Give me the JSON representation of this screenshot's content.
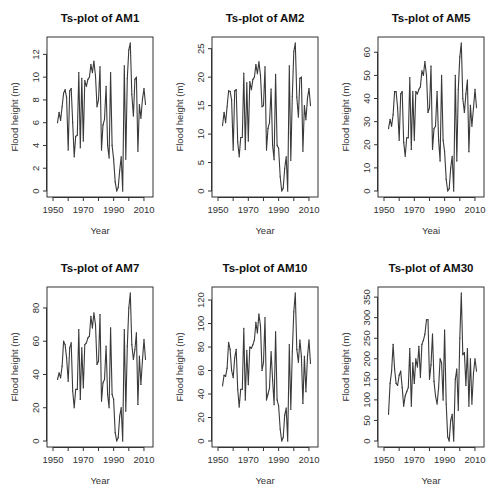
{
  "chart_data": [
    {
      "type": "line",
      "title": "Ts-plot of AM1",
      "xlabel": "Year",
      "ylabel": "Flood height (m)",
      "xlim": [
        1950,
        2012
      ],
      "ylim": [
        0,
        13
      ],
      "xticks": [
        1950,
        1970,
        1990,
        2010
      ],
      "x_minor_ticks": [
        1950,
        1960,
        1970,
        1980,
        1990,
        2000,
        2010
      ],
      "yticks": [
        0,
        2,
        4,
        6,
        8,
        10,
        12
      ],
      "grid": false,
      "x_start": 1953,
      "values": [
        6.0,
        6.9,
        6.2,
        7.4,
        8.6,
        8.9,
        8.2,
        3.6,
        8.8,
        9.0,
        6.0,
        3.0,
        4.8,
        4.9,
        10.4,
        3.8,
        9.9,
        4.4,
        9.7,
        9.2,
        9.8,
        10.0,
        11.1,
        10.4,
        11.4,
        10.1,
        7.4,
        8.0,
        10.9,
        3.6,
        5.8,
        6.3,
        9.2,
        4.0,
        2.9,
        10.4,
        4.0,
        2.8,
        0.8,
        0.0,
        0.3,
        1.8,
        3.0,
        0.0,
        11.0,
        2.8,
        9.9,
        12.4,
        13.0,
        8.5,
        6.6,
        9.8,
        10.0,
        3.5,
        7.6,
        6.4,
        8.1,
        9.0,
        7.6
      ]
    },
    {
      "type": "line",
      "title": "Ts-plot of AM2",
      "xlabel": "Year",
      "ylabel": "Flood height (m)",
      "xlim": [
        1950,
        2012
      ],
      "ylim": [
        0,
        26
      ],
      "xticks": [
        1950,
        1970,
        1990,
        2010
      ],
      "x_minor_ticks": [
        1950,
        1960,
        1970,
        1980,
        1990,
        2000,
        2010
      ],
      "yticks": [
        0,
        5,
        10,
        15,
        20,
        25
      ],
      "grid": false,
      "x_start": 1953,
      "values": [
        11.5,
        13.8,
        12.0,
        14.8,
        17.6,
        17.5,
        16.0,
        7.2,
        17.6,
        17.8,
        8.6,
        6.0,
        9.4,
        9.4,
        20.7,
        7.3,
        19.0,
        8.8,
        19.2,
        17.8,
        19.6,
        20.0,
        22.2,
        20.6,
        22.7,
        20.3,
        14.8,
        15.0,
        21.8,
        7.2,
        11.0,
        12.0,
        17.9,
        8.0,
        5.5,
        20.5,
        8.0,
        7.5,
        2.5,
        0.0,
        0.5,
        4.0,
        6.0,
        0.0,
        22.0,
        5.4,
        16.6,
        24.5,
        26.0,
        16.5,
        13.0,
        19.8,
        20.0,
        7.0,
        15.0,
        12.5,
        16.3,
        18.0,
        15.0
      ]
    },
    {
      "type": "line",
      "title": "Ts-plot of AM5",
      "xlabel": "Yeai",
      "ylabel": "Flood height (m)",
      "xlim": [
        1950,
        2012
      ],
      "ylim": [
        0,
        64
      ],
      "xticks": [
        1950,
        1970,
        1990,
        2010
      ],
      "x_minor_ticks": [
        1950,
        1960,
        1970,
        1980,
        1990,
        2000,
        2010
      ],
      "yticks": [
        0,
        10,
        20,
        30,
        40,
        50,
        60
      ],
      "grid": false,
      "x_start": 1953,
      "values": [
        27,
        31,
        28,
        33,
        43,
        43,
        36,
        22,
        42,
        43,
        21,
        15,
        23,
        23,
        49,
        18,
        43,
        22,
        43,
        42,
        44,
        45,
        52,
        50,
        56,
        50,
        34,
        36,
        54,
        18,
        27,
        28,
        43,
        22,
        13,
        50,
        22,
        17,
        5,
        0,
        1,
        10,
        15,
        0,
        50,
        13,
        44,
        58,
        64,
        40,
        34,
        42,
        48,
        17,
        37,
        28,
        36,
        44,
        36
      ]
    },
    {
      "type": "line",
      "title": "Ts-plot of AM7",
      "xlabel": "Year",
      "ylabel": "Flood height (m)",
      "xlim": [
        1950,
        2012
      ],
      "ylim": [
        0,
        89
      ],
      "xticks": [
        1950,
        1970,
        1990,
        2010
      ],
      "x_minor_ticks": [
        1950,
        1960,
        1970,
        1980,
        1990,
        2000,
        2010
      ],
      "yticks": [
        0,
        20,
        40,
        60,
        80
      ],
      "grid": false,
      "x_start": 1953,
      "values": [
        37,
        41,
        38,
        45,
        60,
        58,
        50,
        36,
        56,
        59,
        30,
        20,
        31,
        31,
        67,
        25,
        56,
        32,
        58,
        59,
        62,
        63,
        75,
        68,
        77,
        70,
        46,
        48,
        76,
        24,
        35,
        37,
        57,
        28,
        20,
        68,
        28,
        25,
        5,
        0,
        2,
        15,
        20,
        0,
        67,
        18,
        57,
        80,
        89,
        58,
        49,
        55,
        65,
        22,
        51,
        34,
        49,
        61,
        49
      ]
    },
    {
      "type": "line",
      "title": "Ts-plot of AM10",
      "xlabel": "Year",
      "ylabel": "Flood height (m)",
      "xlim": [
        1950,
        2012
      ],
      "ylim": [
        0,
        126
      ],
      "xticks": [
        1950,
        1970,
        1990,
        2010
      ],
      "x_minor_ticks": [
        1950,
        1960,
        1970,
        1980,
        1990,
        2000,
        2010
      ],
      "yticks": [
        0,
        20,
        40,
        60,
        80,
        100,
        120
      ],
      "grid": false,
      "x_start": 1953,
      "values": [
        47,
        56,
        55,
        62,
        84,
        78,
        60,
        54,
        71,
        78,
        44,
        29,
        44,
        44,
        96,
        35,
        77,
        48,
        80,
        79,
        82,
        86,
        101,
        92,
        108,
        98,
        60,
        67,
        105,
        35,
        40,
        45,
        76,
        52,
        31,
        93,
        35,
        30,
        10,
        0,
        3,
        22,
        28,
        0,
        82,
        27,
        76,
        110,
        126,
        78,
        67,
        86,
        72,
        32,
        72,
        42,
        72,
        86,
        66
      ]
    },
    {
      "type": "line",
      "title": "Ts-plot of AM30",
      "xlabel": "Year",
      "ylabel": "Flood height (m)",
      "xlim": [
        1950,
        2012
      ],
      "ylim": [
        0,
        360
      ],
      "xticks": [
        1950,
        1970,
        1990,
        2010
      ],
      "x_minor_ticks": [
        1950,
        1960,
        1970,
        1980,
        1990,
        2000,
        2010
      ],
      "yticks": [
        0,
        50,
        100,
        150,
        200,
        250,
        300,
        350
      ],
      "grid": false,
      "x_start": 1953,
      "values": [
        65,
        140,
        170,
        235,
        175,
        140,
        135,
        160,
        170,
        130,
        85,
        110,
        120,
        130,
        225,
        85,
        190,
        140,
        200,
        180,
        230,
        155,
        235,
        245,
        260,
        295,
        295,
        150,
        185,
        260,
        145,
        110,
        90,
        130,
        200,
        190,
        100,
        270,
        90,
        10,
        0,
        50,
        65,
        0,
        150,
        175,
        75,
        250,
        360,
        210,
        215,
        135,
        225,
        85,
        200,
        90,
        165,
        200,
        170
      ]
    }
  ]
}
